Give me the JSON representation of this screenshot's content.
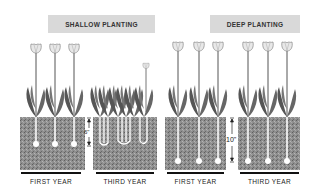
{
  "diagram": {
    "topic": "tulip planting depth comparison",
    "sections": [
      {
        "title": "SHALLOW PLANTING",
        "depth_label": "6\"",
        "panels": [
          {
            "label": "FIRST YEAR",
            "tulips": 3,
            "state": "single tall blooms"
          },
          {
            "label": "THIRD YEAR",
            "tulips": 1,
            "state": "crowded foliage, split bulbs, one small bloom"
          }
        ]
      },
      {
        "title": "DEEP PLANTING",
        "depth_label": "10\"",
        "panels": [
          {
            "label": "FIRST YEAR",
            "tulips": 3,
            "state": "single tall blooms"
          },
          {
            "label": "THIRD YEAR",
            "tulips": 3,
            "state": "single tall blooms"
          }
        ]
      }
    ],
    "colors": {
      "title_bg": "#d9d9d9",
      "soil": "#8a8a8a",
      "stem": "#ffffff",
      "leaf": "#555555",
      "flower": "#e6e6e6"
    }
  }
}
